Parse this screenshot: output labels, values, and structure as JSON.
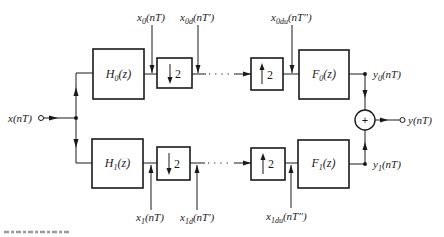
{
  "diagram": {
    "input": {
      "base": "x",
      "arg": "(nT)"
    },
    "output": {
      "base": "y",
      "arg": "(nT)"
    },
    "adder": {
      "symbol": "+"
    },
    "branches": [
      {
        "analysis_filter": {
          "base": "H",
          "sub": "0",
          "arg": "(z)"
        },
        "decimator": {
          "factor": "2",
          "direction": "down"
        },
        "interpolator": {
          "factor": "2",
          "direction": "up"
        },
        "synthesis_filter": {
          "base": "F",
          "sub": "0",
          "arg": "(z)"
        },
        "signals": {
          "filtered": {
            "base": "x",
            "sub": "0",
            "arg": "(nT)"
          },
          "decimated": {
            "base": "x",
            "sub": "0d",
            "arg": "(nT′)"
          },
          "interpolated": {
            "base": "x",
            "sub": "0du",
            "arg": "(nT′′)"
          },
          "output": {
            "base": "y",
            "sub": "0",
            "arg": "(nT)"
          }
        }
      },
      {
        "analysis_filter": {
          "base": "H",
          "sub": "1",
          "arg": "(z)"
        },
        "decimator": {
          "factor": "2",
          "direction": "down"
        },
        "interpolator": {
          "factor": "2",
          "direction": "up"
        },
        "synthesis_filter": {
          "base": "F",
          "sub": "1",
          "arg": "(z)"
        },
        "signals": {
          "filtered": {
            "base": "x",
            "sub": "1",
            "arg": "(nT)"
          },
          "decimated": {
            "base": "x",
            "sub": "1d",
            "arg": "(nT′)"
          },
          "interpolated": {
            "base": "x",
            "sub": "1du",
            "arg": "(nT′′)"
          },
          "output": {
            "base": "y",
            "sub": "1",
            "arg": "(nT)"
          }
        }
      }
    ],
    "colors": {
      "ink": "#1a1a1a",
      "background": "#ffffff",
      "caption_fragment": "#9a9a9a"
    }
  }
}
